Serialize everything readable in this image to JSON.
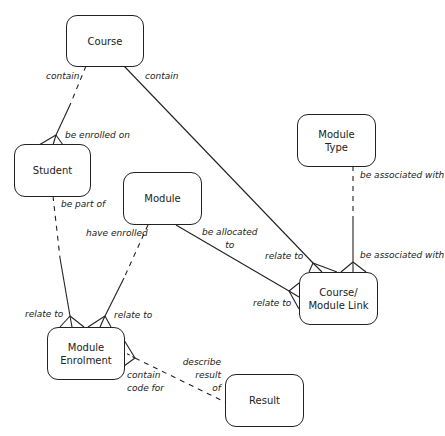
{
  "entities": {
    "course": "Course",
    "student": "Student",
    "module": "Module",
    "module_type": "Module\nType",
    "course_module_link": "Course/\nModule Link",
    "module_enrolment": "Module\nEnrolment",
    "result": "Result"
  },
  "relationships": {
    "course_contain_student": "contain",
    "student_enrolled_on_course": "be enrolled on",
    "course_contain_link": "contain",
    "link_relate_to_course": "relate to",
    "moduletype_associated": "be associated with",
    "link_associated_moduletype": "be associated with",
    "student_part_of": "be part of",
    "enrolment_relate_to_student": "relate to",
    "module_have_enrolled": "have enrolled",
    "enrolment_relate_to_module": "relate to",
    "module_allocated_to": "be allocated\nto",
    "link_relate_to_module": "relate to",
    "enrolment_contain_code": "contain\ncode for",
    "result_describe": "describe\nresult\nof"
  }
}
